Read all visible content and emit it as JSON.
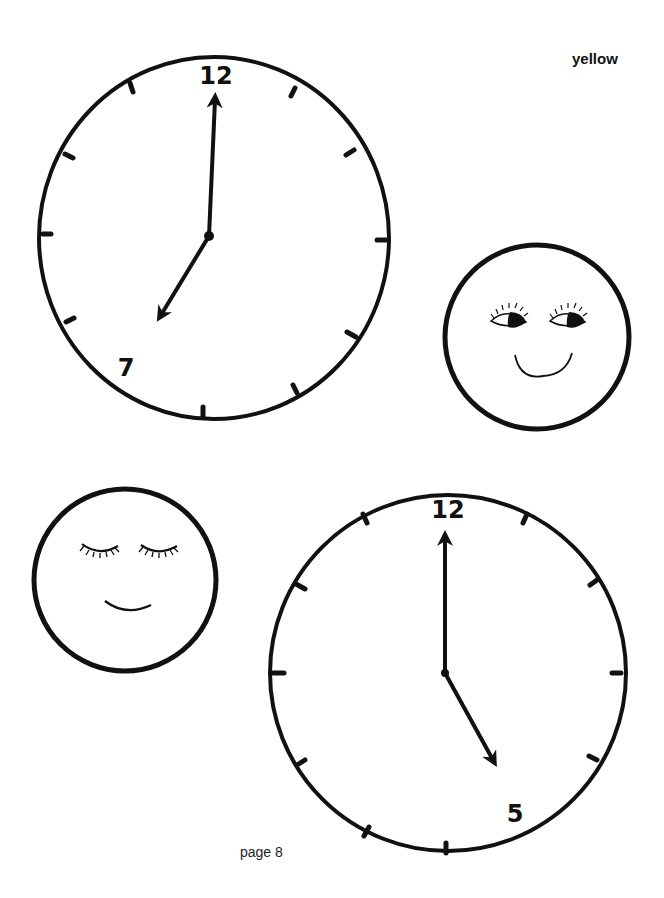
{
  "header": {
    "color_label": "yellow"
  },
  "footer": {
    "page_label": "page 8"
  },
  "clocks": [
    {
      "id": "clock-seven",
      "time": "7:00",
      "labels": {
        "top": "12",
        "hour": "7"
      }
    },
    {
      "id": "clock-five",
      "time": "5:00",
      "labels": {
        "top": "12",
        "hour": "5"
      }
    }
  ],
  "faces": [
    {
      "id": "face-awake",
      "expression": "eyes-open-smile"
    },
    {
      "id": "face-asleep",
      "expression": "eyes-closed-smile"
    }
  ],
  "colors": {
    "ink": "#111111",
    "paper": "#ffffff"
  }
}
